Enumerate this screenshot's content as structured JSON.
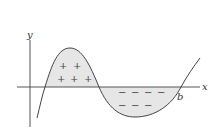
{
  "diagram": {
    "title": "",
    "labels": {
      "y_axis": "y",
      "x_axis": "x",
      "b_point": "b"
    },
    "regions": [
      {
        "name": "positive-region",
        "sign": "+",
        "symbols": [
          "+",
          "+",
          "+",
          "+",
          "+"
        ]
      },
      {
        "name": "negative-region",
        "sign": "−",
        "symbols": [
          "−",
          "−",
          "−",
          "−",
          "−",
          "−",
          "−"
        ]
      }
    ],
    "colors": {
      "curve": "#444444",
      "axis": "#555555",
      "fill": "#e6e6e6",
      "text": "#333333"
    }
  }
}
